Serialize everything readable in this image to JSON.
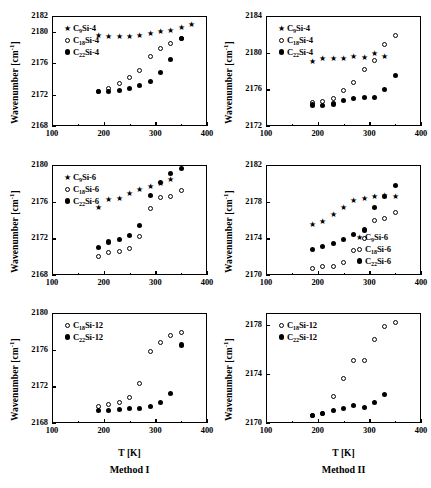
{
  "figure": {
    "columns": [
      {
        "id": "method-1",
        "label": "Method I",
        "xlabel": "T [K]"
      },
      {
        "id": "method-2",
        "label": "Method II",
        "xlabel": "T [K]"
      }
    ],
    "ylabel_text": "Wavenumber [cm",
    "ylabel_sup": "-1",
    "ylabel_tail": "]"
  },
  "chart_data": [
    {
      "id": "panel-top-left",
      "type": "scatter",
      "title": "",
      "xlabel": "T [K]",
      "ylabel": "Wavenumber [cm-1]",
      "xlim": [
        100,
        400
      ],
      "ylim": [
        2168,
        2182
      ],
      "xticks": [
        100,
        200,
        300,
        400
      ],
      "yticks": [
        2168,
        2172,
        2176,
        2180,
        2182
      ],
      "grid": false,
      "legend_position": "upper-left",
      "series": [
        {
          "name": "C9Si-4",
          "label_c": "C",
          "label_sub": "9",
          "label_rest": "Si-4",
          "marker": "star",
          "x": [
            230,
            250,
            270,
            290,
            310,
            330,
            350,
            190,
            210,
            370
          ],
          "y": [
            2179.4,
            2179.4,
            2179.5,
            2179.8,
            2180.0,
            2180.2,
            2180.6,
            2179.5,
            2179.4,
            2180.9
          ]
        },
        {
          "name": "C18Si-4",
          "label_c": "C",
          "label_sub": "18",
          "label_rest": "Si-4",
          "marker": "open",
          "x": [
            190,
            210,
            230,
            250,
            270,
            290,
            310,
            330,
            350
          ],
          "y": [
            2172.4,
            2172.7,
            2173.4,
            2174.1,
            2175.1,
            2176.8,
            2177.9,
            2178.5,
            2179.1
          ]
        },
        {
          "name": "C22Si-4",
          "label_c": "C",
          "label_sub": "22",
          "label_rest": "Si-4",
          "marker": "filled",
          "x": [
            190,
            210,
            230,
            250,
            270,
            290,
            310,
            330,
            350
          ],
          "y": [
            2172.4,
            2172.4,
            2172.5,
            2172.8,
            2173.2,
            2173.7,
            2174.8,
            2176.5,
            2179.1
          ]
        }
      ]
    },
    {
      "id": "panel-top-right",
      "type": "scatter",
      "title": "",
      "xlabel": "T [K]",
      "ylabel": "Wavenumber [cm-1]",
      "xlim": [
        100,
        400
      ],
      "ylim": [
        2172,
        2184
      ],
      "xticks": [
        100,
        200,
        300,
        400
      ],
      "yticks": [
        2172,
        2176,
        2180,
        2184
      ],
      "grid": false,
      "legend_position": "upper-left",
      "series": [
        {
          "name": "C9Si-4",
          "label_c": "C",
          "label_sub": "9",
          "label_rest": "Si-4",
          "marker": "star",
          "x": [
            190,
            210,
            230,
            250,
            270,
            290,
            310,
            330
          ],
          "y": [
            2179.0,
            2179.4,
            2179.4,
            2179.4,
            2179.6,
            2179.5,
            2179.9,
            2179.6
          ]
        },
        {
          "name": "C18Si-4",
          "label_c": "C",
          "label_sub": "18",
          "label_rest": "Si-4",
          "marker": "open",
          "x": [
            190,
            210,
            230,
            250,
            270,
            290,
            310,
            330,
            350
          ],
          "y": [
            2174.6,
            2174.7,
            2175.0,
            2175.9,
            2176.7,
            2178.2,
            2179.1,
            2180.9,
            2181.9
          ]
        },
        {
          "name": "C22Si-4",
          "label_c": "C",
          "label_sub": "22",
          "label_rest": "Si-4",
          "marker": "filled",
          "x": [
            190,
            210,
            230,
            250,
            270,
            290,
            310,
            330,
            350
          ],
          "y": [
            2174.3,
            2174.2,
            2174.4,
            2174.8,
            2175.0,
            2175.1,
            2175.1,
            2176.0,
            2177.5
          ]
        }
      ]
    },
    {
      "id": "panel-mid-left",
      "type": "scatter",
      "title": "",
      "xlabel": "T [K]",
      "ylabel": "Wavenumber [cm-1]",
      "xlim": [
        100,
        400
      ],
      "ylim": [
        2168,
        2180
      ],
      "xticks": [
        100,
        200,
        300,
        400
      ],
      "yticks": [
        2168,
        2172,
        2176,
        2180
      ],
      "grid": false,
      "legend_position": "upper-left",
      "series": [
        {
          "name": "C9Si-6",
          "label_c": "C",
          "label_sub": "9",
          "label_rest": "Si-6",
          "marker": "star",
          "x": [
            190,
            210,
            230,
            250,
            270,
            290,
            310,
            330
          ],
          "y": [
            2175.4,
            2176.2,
            2176.3,
            2176.9,
            2177.3,
            2177.7,
            2178.0,
            2178.4
          ]
        },
        {
          "name": "C18Si-6",
          "label_c": "C",
          "label_sub": "18",
          "label_rest": "Si-6",
          "marker": "open",
          "x": [
            190,
            210,
            230,
            250,
            270,
            290,
            310,
            330,
            350
          ],
          "y": [
            2170.0,
            2170.4,
            2170.6,
            2170.9,
            2172.2,
            2175.2,
            2176.4,
            2176.6,
            2177.2
          ]
        },
        {
          "name": "C22Si-6",
          "label_c": "C",
          "label_sub": "22",
          "label_rest": "Si-6",
          "marker": "filled",
          "x": [
            190,
            210,
            230,
            250,
            270,
            290,
            310,
            330,
            350
          ],
          "y": [
            2171.0,
            2171.6,
            2171.9,
            2172.3,
            2173.4,
            2176.7,
            2178.1,
            2179.1,
            2179.6
          ]
        }
      ]
    },
    {
      "id": "panel-mid-right",
      "type": "scatter",
      "title": "",
      "xlabel": "T [K]",
      "ylabel": "Wavenumber [cm-1]",
      "xlim": [
        100,
        400
      ],
      "ylim": [
        2170,
        2182
      ],
      "xticks": [
        100,
        200,
        300,
        400
      ],
      "yticks": [
        2170,
        2174,
        2178,
        2182
      ],
      "grid": false,
      "legend_position": "lower-right",
      "series": [
        {
          "name": "C9Si-6",
          "label_c": "C",
          "label_sub": "9",
          "label_rest": "Si-6",
          "marker": "star",
          "x": [
            190,
            210,
            230,
            250,
            270,
            290,
            310,
            330,
            350
          ],
          "y": [
            2175.5,
            2175.8,
            2176.6,
            2177.4,
            2178.1,
            2178.3,
            2178.6,
            2178.7,
            2178.6
          ]
        },
        {
          "name": "C18Si-6",
          "label_c": "C",
          "label_sub": "18",
          "label_rest": "Si-6",
          "marker": "open",
          "x": [
            190,
            210,
            230,
            250,
            270,
            290,
            310,
            330,
            350
          ],
          "y": [
            2170.7,
            2170.9,
            2170.9,
            2171.4,
            2172.7,
            2174.0,
            2175.9,
            2176.2,
            2176.8
          ]
        },
        {
          "name": "C22Si-6",
          "label_c": "C",
          "label_sub": "22",
          "label_rest": "Si-6",
          "marker": "filled",
          "x": [
            190,
            210,
            230,
            250,
            270,
            290,
            310,
            330,
            350
          ],
          "y": [
            2172.8,
            2173.1,
            2173.4,
            2173.9,
            2174.4,
            2174.9,
            2177.4,
            2178.6,
            2179.8
          ]
        }
      ]
    },
    {
      "id": "panel-bot-left",
      "type": "scatter",
      "title": "",
      "xlabel": "T [K]",
      "ylabel": "Wavenumber [cm-1]",
      "xlim": [
        100,
        400
      ],
      "ylim": [
        2168,
        2180
      ],
      "xticks": [
        100,
        200,
        300,
        400
      ],
      "yticks": [
        2168,
        2172,
        2176,
        2180
      ],
      "grid": false,
      "legend_position": "upper-left",
      "series": [
        {
          "name": "C18Si-12",
          "label_c": "C",
          "label_sub": "18",
          "label_rest": "Si-12",
          "marker": "open",
          "x": [
            190,
            210,
            230,
            250,
            270,
            290,
            310,
            330,
            350
          ],
          "y": [
            2169.8,
            2170.0,
            2170.2,
            2170.8,
            2172.3,
            2175.8,
            2176.8,
            2177.5,
            2177.9
          ]
        },
        {
          "name": "C22Si-12",
          "label_c": "C",
          "label_sub": "22",
          "label_rest": "Si-12",
          "marker": "filled",
          "x": [
            190,
            210,
            230,
            250,
            270,
            290,
            310,
            330,
            350
          ],
          "y": [
            2169.4,
            2169.4,
            2169.5,
            2169.6,
            2169.6,
            2169.8,
            2170.2,
            2171.2,
            2176.5
          ]
        }
      ]
    },
    {
      "id": "panel-bot-right",
      "type": "scatter",
      "title": "",
      "xlabel": "T [K]",
      "ylabel": "Wavenumber [cm-1]",
      "xlim": [
        100,
        400
      ],
      "ylim": [
        2170,
        2179
      ],
      "xticks": [
        100,
        200,
        300,
        400
      ],
      "yticks": [
        2170,
        2174,
        2178
      ],
      "grid": false,
      "legend_position": "upper-left",
      "series": [
        {
          "name": "C18Si-12",
          "label_c": "C",
          "label_sub": "18",
          "label_rest": "Si-12",
          "marker": "open",
          "x": [
            190,
            210,
            230,
            250,
            270,
            290,
            310,
            330,
            350
          ],
          "y": [
            2170.6,
            2170.8,
            2172.2,
            2173.6,
            2175.1,
            2175.1,
            2176.8,
            2177.9,
            2178.2
          ]
        },
        {
          "name": "C22Si-12",
          "label_c": "C",
          "label_sub": "22",
          "label_rest": "Si-12",
          "marker": "filled",
          "x": [
            190,
            210,
            230,
            250,
            270,
            290,
            310,
            330
          ],
          "y": [
            2170.6,
            2170.8,
            2171.0,
            2171.2,
            2171.4,
            2171.3,
            2171.7,
            2172.3
          ]
        }
      ]
    }
  ]
}
